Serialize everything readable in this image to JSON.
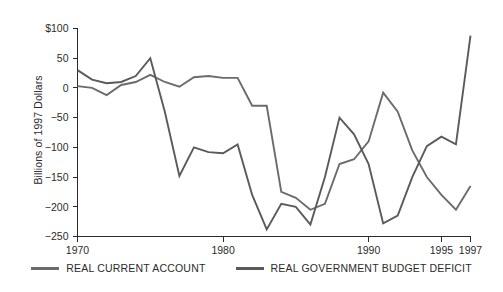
{
  "chart_data": {
    "type": "line",
    "title": "",
    "xlabel": "",
    "ylabel": "Billions of 1997 Dollars",
    "xlim": [
      1970,
      1997
    ],
    "ylim": [
      -250,
      100
    ],
    "grid": false,
    "legend_position": "bottom",
    "x_ticks": [
      1970,
      1980,
      1990,
      1995,
      1997
    ],
    "x_tick_labels": [
      "1970",
      "1980",
      "1990",
      "1995",
      "1997"
    ],
    "y_ticks": [
      -250,
      -200,
      -150,
      -100,
      -50,
      0,
      50,
      100
    ],
    "y_tick_labels": [
      "−250",
      "−200",
      "−150",
      "−100",
      "−50",
      "0",
      "50",
      "$100"
    ],
    "x": [
      1970,
      1971,
      1972,
      1973,
      1974,
      1975,
      1976,
      1977,
      1978,
      1979,
      1980,
      1981,
      1982,
      1983,
      1984,
      1985,
      1986,
      1987,
      1988,
      1989,
      1990,
      1991,
      1992,
      1993,
      1994,
      1995,
      1996,
      1997
    ],
    "series": [
      {
        "name": "REAL CURRENT ACCOUNT",
        "color": "#6b6b6b",
        "values": [
          3,
          0,
          -12,
          5,
          10,
          22,
          10,
          2,
          18,
          20,
          17,
          17,
          -30,
          -30,
          -175,
          -185,
          -205,
          -195,
          -128,
          -120,
          -90,
          -8,
          -40,
          -105,
          -150,
          -180,
          -205,
          -165
        ]
      },
      {
        "name": "REAL GOVERNMENT BUDGET DEFICIT",
        "color": "#5a5a5a",
        "values": [
          30,
          14,
          8,
          10,
          20,
          50,
          -40,
          -148,
          -100,
          -108,
          -110,
          -95,
          -180,
          -238,
          -195,
          -200,
          -230,
          -150,
          -50,
          -78,
          -128,
          -228,
          -215,
          -150,
          -98,
          -82,
          -95,
          88
        ]
      }
    ]
  },
  "legend": {
    "items": [
      {
        "label": "REAL CURRENT ACCOUNT"
      },
      {
        "label": "REAL GOVERNMENT BUDGET DEFICIT"
      }
    ]
  }
}
